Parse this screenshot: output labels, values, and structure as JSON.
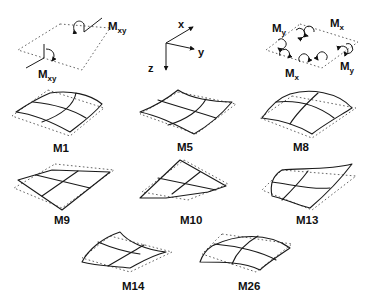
{
  "legend": {
    "twisting": {
      "label_top": "M",
      "sub_top": "xy",
      "label_bottom": "M",
      "sub_bottom": "xy"
    },
    "axes": {
      "x": "x",
      "y": "y",
      "z": "z"
    },
    "bending": {
      "my_left": "M",
      "my_left_sub": "y",
      "mx_top": "M",
      "mx_top_sub": "x",
      "mx_bottom": "M",
      "mx_bottom_sub": "x",
      "my_right": "M",
      "my_right_sub": "y"
    }
  },
  "modes": [
    {
      "id": "M1",
      "label": "M1"
    },
    {
      "id": "M5",
      "label": "M5"
    },
    {
      "id": "M8",
      "label": "M8"
    },
    {
      "id": "M9",
      "label": "M9"
    },
    {
      "id": "M10",
      "label": "M10"
    },
    {
      "id": "M13",
      "label": "M13"
    },
    {
      "id": "M14",
      "label": "M14"
    },
    {
      "id": "M26",
      "label": "M26"
    }
  ]
}
